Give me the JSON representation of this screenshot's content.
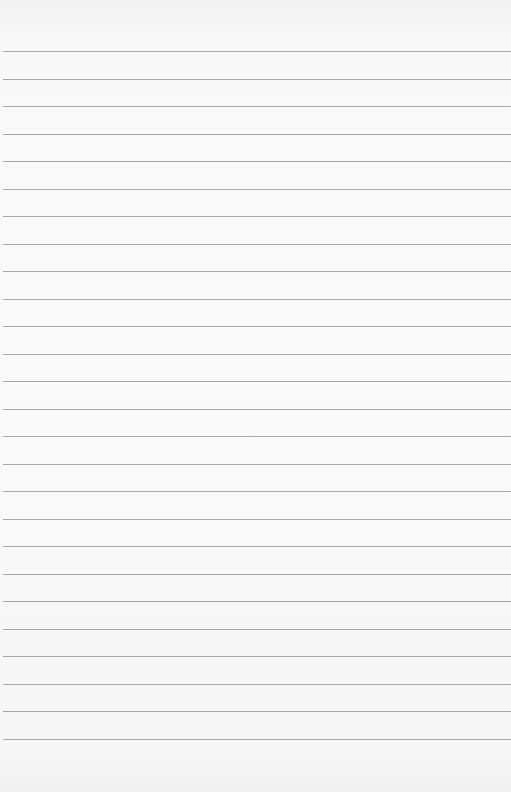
{
  "paper": {
    "type": "lined-paper",
    "background_color": "#f8f8f8",
    "line_color": "#9a9a9a",
    "line_count": 26,
    "first_line_y": 51,
    "line_spacing": 27.5
  }
}
